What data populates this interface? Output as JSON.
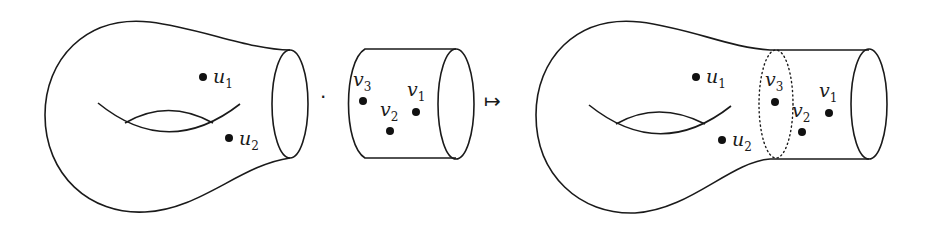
{
  "diagram": {
    "left_surface": {
      "type": "genus-1 surface with one boundary circle",
      "points": [
        {
          "name": "u",
          "sub": "1"
        },
        {
          "name": "u",
          "sub": "2"
        }
      ]
    },
    "operator_dot": "·",
    "cylinder": {
      "type": "cylinder",
      "points": [
        {
          "name": "v",
          "sub": "3"
        },
        {
          "name": "v",
          "sub": "2"
        },
        {
          "name": "v",
          "sub": "1"
        }
      ]
    },
    "maps_to": "↦",
    "result_surface": {
      "type": "genus-1 surface with glued cylinder; dotted gluing circle",
      "points": [
        {
          "name": "u",
          "sub": "1"
        },
        {
          "name": "u",
          "sub": "2"
        },
        {
          "name": "v",
          "sub": "3"
        },
        {
          "name": "v",
          "sub": "2"
        },
        {
          "name": "v",
          "sub": "1"
        }
      ]
    },
    "colors": {
      "line": "#1a1a1a",
      "background": "#ffffff"
    }
  }
}
